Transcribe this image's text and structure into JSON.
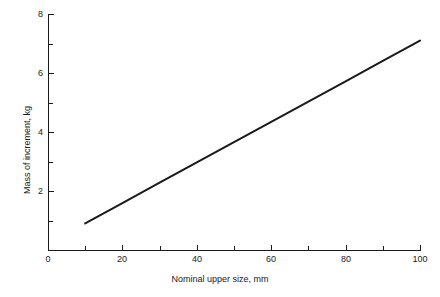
{
  "chart_data": {
    "type": "line",
    "title": "",
    "subtitle": "",
    "xlabel": "Nominal upper size, mm",
    "ylabel": "Mass of increment, kg",
    "xlim": [
      0,
      100
    ],
    "ylim": [
      0,
      8
    ],
    "grid": false,
    "legend": null,
    "x_major_ticks": [
      0,
      20,
      40,
      60,
      80,
      100
    ],
    "x_minor_ticks": [
      10,
      30,
      50,
      70,
      90
    ],
    "y_major_ticks": [
      2,
      4,
      6,
      8
    ],
    "y_minor_ticks": [
      1,
      3,
      5,
      7
    ],
    "x_tick_labels": [
      "0",
      "20",
      "40",
      "60",
      "80",
      "100"
    ],
    "y_tick_labels": [
      "2",
      "4",
      "6",
      "8"
    ],
    "series": [
      {
        "name": "Mass of increment",
        "color": "#1a1a1a",
        "line_width": 2,
        "x": [
          10,
          20,
          30,
          40,
          50,
          60,
          70,
          80,
          90,
          100
        ],
        "y": [
          0.9,
          1.59,
          2.28,
          2.97,
          3.66,
          4.34,
          5.03,
          5.72,
          6.41,
          7.1
        ]
      }
    ],
    "annotations": []
  },
  "axis": {
    "x_title": "Nominal upper size, mm",
    "y_title": "Mass of increment, kg"
  },
  "x_labels": [
    "0",
    "20",
    "40",
    "60",
    "80",
    "100"
  ],
  "y_labels": [
    "2",
    "4",
    "6",
    "8"
  ],
  "colors": {
    "line": "#1a1a1a",
    "axis": "#1a1a1a",
    "background": "#ffffff"
  }
}
